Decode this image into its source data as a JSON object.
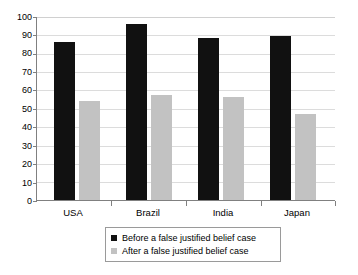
{
  "chart_data": {
    "type": "bar",
    "title": "",
    "subtitle": "",
    "xlabel": "",
    "ylabel": "",
    "categories": [
      "USA",
      "Brazil",
      "India",
      "Japan"
    ],
    "series": [
      {
        "name": "Before a false justified belief case",
        "color": "#111111",
        "values": [
          86,
          95.5,
          88,
          89
        ]
      },
      {
        "name": "After a false justified belief case",
        "color": "#c2c2c2",
        "values": [
          54,
          57,
          56,
          47
        ]
      }
    ],
    "ylim": [
      0,
      100
    ],
    "ytick_step": 10,
    "yticks": [
      "100",
      "90",
      "80",
      "70",
      "60",
      "50",
      "40",
      "30",
      "20",
      "10",
      "0"
    ],
    "grid": true,
    "grid_axis": "y",
    "legend_position": "bottom",
    "legend_entries": [
      {
        "label": "Before a false justified belief case",
        "swatch": "#111111"
      },
      {
        "label": "After a false justified belief case",
        "swatch": "#c2c2c2"
      }
    ]
  }
}
